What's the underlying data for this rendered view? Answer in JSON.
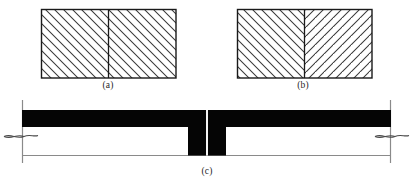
{
  "figure": {
    "panels": [
      {
        "id": "a",
        "caption": "(a)",
        "description": "two adjacent parts with parallel section hatching in the same direction",
        "hatch_left": "down-right",
        "hatch_right": "down-right"
      },
      {
        "id": "b",
        "caption": "(b)",
        "description": "two adjacent parts with mirrored section hatching in opposite directions",
        "hatch_left": "down-right",
        "hatch_right": "up-right"
      },
      {
        "id": "c",
        "caption": "(c)",
        "description": "elevation section of two mirrored beam members meeting at a central joint gap, with break lines at both ends",
        "joint": "center gap",
        "end_symbol": "break-line"
      }
    ],
    "colors": {
      "outline": "#1a1a1a",
      "hatch": "#3b3b3b",
      "solid_fill": "#050505",
      "reference_line": "#8a8a8a",
      "background": "#ffffff"
    }
  }
}
